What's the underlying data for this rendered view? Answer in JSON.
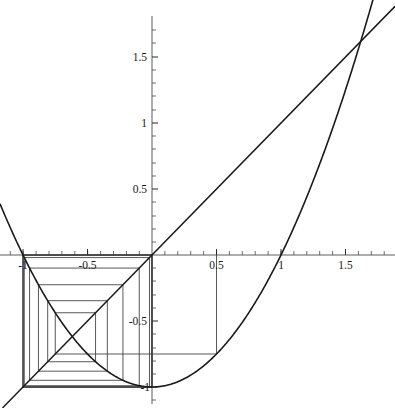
{
  "figure": {
    "title": "",
    "kind": "cobweb-diagram",
    "background": "#ffffff",
    "stroke": "#1a1a1a",
    "width": 395,
    "height": 408
  },
  "axes": {
    "origin_px": {
      "x": 152,
      "y": 255
    },
    "px_per_unit_x": 129,
    "px_per_unit_y": 132,
    "xlim": [
      -1.18,
      1.83
    ],
    "ylim": [
      -1.16,
      1.93
    ],
    "x_tick_labels": [
      {
        "text": "-1",
        "value": -1
      },
      {
        "text": "-0.5",
        "value": -0.5
      },
      {
        "text": "0.5",
        "value": 0.5
      },
      {
        "text": "1",
        "value": 1
      },
      {
        "text": "1.5",
        "value": 1.5
      }
    ],
    "y_tick_labels": [
      {
        "text": "1.5",
        "value": 1.5
      },
      {
        "text": "1",
        "value": 1
      },
      {
        "text": "0.5",
        "value": 0.5
      },
      {
        "text": "-0.5",
        "value": -0.5
      },
      {
        "text": "-1",
        "value": -1
      }
    ],
    "minor_tick_step": 0.1,
    "grid": false,
    "legend": null
  },
  "chart_data": {
    "type": "line",
    "title": "",
    "xlabel": "",
    "ylabel": "",
    "xlim": [
      -1.18,
      1.83
    ],
    "ylim": [
      -1.16,
      1.93
    ],
    "grid": false,
    "legend_position": "none",
    "x_ticks": [
      -1,
      -0.5,
      0.5,
      1,
      1.5
    ],
    "y_ticks": [
      1.5,
      1,
      0.5,
      -0.5,
      -1
    ],
    "series": [
      {
        "name": "f(x) = x^2 - 1",
        "kind": "parabola",
        "equation": "y = x^2 - 1",
        "vertex": [
          0,
          -1
        ],
        "x_range": [
          -1.18,
          1.83
        ],
        "roots": [
          -1,
          1
        ]
      },
      {
        "name": "y = x",
        "kind": "line",
        "equation": "y = x",
        "slope": 1,
        "intercept": 0,
        "x_range": [
          -1.18,
          1.83
        ]
      },
      {
        "name": "cobweb orbit",
        "kind": "cobweb",
        "seed": 0.5,
        "map": "x^2 - 1",
        "orbit": [
          0.5,
          -0.75,
          -0.4375,
          -0.80859375,
          -0.34617,
          -0.88017,
          -0.2253,
          -0.94924,
          -0.09894,
          -0.99021,
          -0.01952,
          -0.99962,
          -0.00076,
          -1.0,
          0.0,
          -1.0,
          0.0,
          -1.0
        ],
        "attractor_period": 2,
        "attractor_points": [
          0,
          -1
        ]
      }
    ],
    "fixed_points": [
      {
        "x": 1.618033988,
        "y": 1.618033988,
        "label": "phi"
      },
      {
        "x": -0.618033988,
        "y": -0.618033988,
        "label": "1-phi"
      }
    ]
  }
}
